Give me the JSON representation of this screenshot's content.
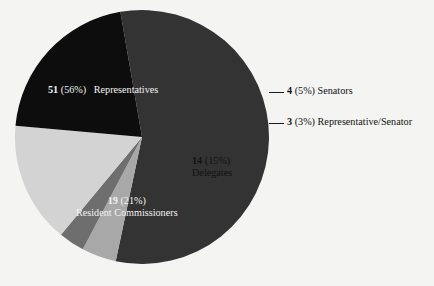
{
  "chart_data": {
    "type": "pie",
    "title": "",
    "subtitle": "",
    "xlabel": "",
    "ylabel": "",
    "legend_position": "none",
    "grid": false,
    "total": 91,
    "categories": [
      "Representatives",
      "Senators",
      "Representative/Senator",
      "Delegates",
      "Resident Commissioners"
    ],
    "values": [
      51,
      4,
      3,
      14,
      19
    ],
    "percentages": [
      56,
      5,
      3,
      15,
      21
    ],
    "colors": [
      "#333333",
      "#a8a8a8",
      "#6e6e6e",
      "#d3d3d3",
      "#0d0d0d"
    ],
    "slices": [
      {
        "name": "Representatives",
        "count": 51,
        "percent": 56,
        "count_text": "51",
        "percent_text": "(56%)",
        "label_text": "Representatives",
        "color": "#333333",
        "label_placement": "inside",
        "label_color": "light",
        "leader_line": false
      },
      {
        "name": "Senators",
        "count": 4,
        "percent": 5,
        "count_text": "4",
        "percent_text": "(5%)",
        "label_text": "Senators",
        "color": "#a8a8a8",
        "label_placement": "outside-right",
        "label_color": "dark",
        "leader_line": true
      },
      {
        "name": "Representative/Senator",
        "count": 3,
        "percent": 3,
        "count_text": "3",
        "percent_text": "(3%)",
        "label_text": "Representative/Senator",
        "color": "#6e6e6e",
        "label_placement": "outside-right",
        "label_color": "dark",
        "leader_line": true
      },
      {
        "name": "Delegates",
        "count": 14,
        "percent": 15,
        "count_text": "14",
        "percent_text": "(15%)",
        "label_text": "Delegates",
        "color": "#d3d3d3",
        "label_placement": "inside",
        "label_color": "dark",
        "leader_line": false
      },
      {
        "name": "Resident Commissioners",
        "count": 19,
        "percent": 21,
        "count_text": "19",
        "percent_text": "(21%)",
        "label_text": "Resident Commissioners",
        "color": "#0d0d0d",
        "label_placement": "inside",
        "label_color": "light",
        "leader_line": false
      }
    ],
    "background_color": "#f4f4f3"
  }
}
